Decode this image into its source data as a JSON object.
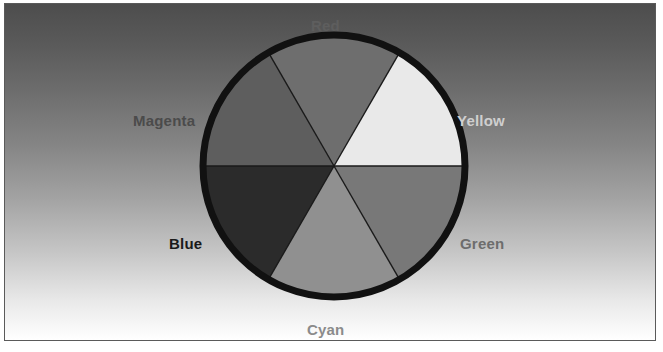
{
  "figure": {
    "title": "",
    "shape": "color-wheel",
    "background": {
      "gradient_from": "#4d4d4d",
      "gradient_to": "#ffffff",
      "direction": "top-to-bottom"
    },
    "frame_color": "#5a5a5a",
    "circle": {
      "center_x": 334,
      "center_y": 166,
      "radius": 131,
      "outline_color": "#111111",
      "outline_width": 7,
      "divider_color": "#1a1a1a",
      "divider_width": 1.4
    }
  },
  "chart_data": {
    "type": "pie",
    "categories": [
      "Red",
      "Yellow",
      "Green",
      "Cyan",
      "Blue",
      "Magenta"
    ],
    "values": [
      60,
      60,
      60,
      60,
      60,
      60
    ],
    "units": "degrees",
    "legend_position": "outside-labels",
    "grid": false,
    "slices": [
      {
        "label": "Red",
        "start_angle": -30,
        "end_angle": 30,
        "fill": "#6e6e6e",
        "label_color": "#5e5e5e",
        "label_position": "top"
      },
      {
        "label": "Yellow",
        "start_angle": 30,
        "end_angle": 90,
        "fill": "#e9e9e9",
        "label_color": "#cfcfcf",
        "label_position": "upper-right"
      },
      {
        "label": "Green",
        "start_angle": 90,
        "end_angle": 150,
        "fill": "#787878",
        "label_color": "#6d6d6d",
        "label_position": "lower-right"
      },
      {
        "label": "Cyan",
        "start_angle": 150,
        "end_angle": 210,
        "fill": "#909090",
        "label_color": "#8b8b8b",
        "label_position": "bottom"
      },
      {
        "label": "Blue",
        "start_angle": 210,
        "end_angle": 270,
        "fill": "#2b2b2b",
        "label_color": "#1a1a1a",
        "label_position": "lower-left"
      },
      {
        "label": "Magenta",
        "start_angle": 270,
        "end_angle": 330,
        "fill": "#5e5e5e",
        "label_color": "#4b4b4b",
        "label_position": "upper-left"
      }
    ]
  },
  "labels": {
    "red": "Red",
    "yellow": "Yellow",
    "green": "Green",
    "cyan": "Cyan",
    "blue": "Blue",
    "magenta": "Magenta"
  }
}
